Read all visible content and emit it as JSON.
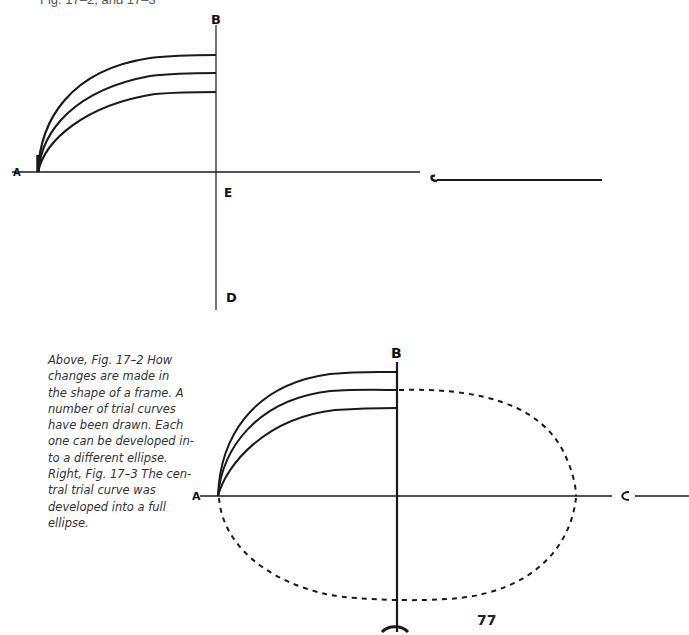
{
  "header": {
    "text": "Fig. 17–2, and 17–3"
  },
  "figure_top": {
    "id": "Fig. 17–2",
    "labels": {
      "a": "A",
      "b": "B",
      "c": "C",
      "d": "D",
      "e": "E"
    },
    "trial_curve_count": 3
  },
  "figure_bottom": {
    "id": "Fig. 17–3",
    "labels": {
      "a": "A",
      "b": "B",
      "c": "C"
    },
    "trial_curve_count": 3,
    "developed_curve": "central"
  },
  "caption": {
    "lines": [
      "Above, Fig. 17–2 How",
      "changes are made in",
      "the shape of a frame. A",
      "number of trial curves",
      "have been drawn. Each",
      "one can be developed in-",
      "to a different ellipse.",
      "Right, Fig. 17–3 The cen-",
      "tral trial curve was",
      "developed into a full",
      "ellipse."
    ]
  },
  "page": {
    "number": "77"
  },
  "colors": {
    "ink": "#1a1a1a",
    "text": "#333333",
    "background": "#ffffff"
  }
}
